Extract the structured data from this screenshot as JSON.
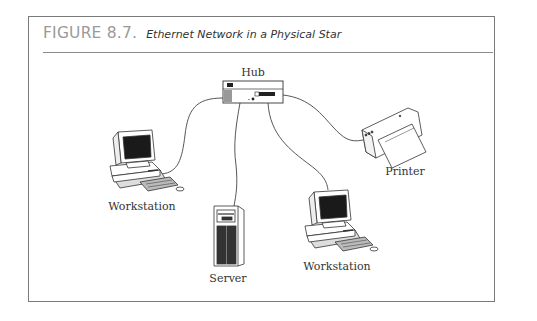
{
  "figure": {
    "number": "FIGURE 8.7.",
    "title": "Ethernet Network in a Physical Star"
  },
  "nodes": {
    "hub": {
      "label": "Hub"
    },
    "workstation_left": {
      "label": "Workstation"
    },
    "server": {
      "label": "Server"
    },
    "workstation_right": {
      "label": "Workstation"
    },
    "printer": {
      "label": "Printer"
    }
  },
  "topology": "physical star",
  "connections": [
    {
      "from": "Hub",
      "to": "Workstation (left)"
    },
    {
      "from": "Hub",
      "to": "Server"
    },
    {
      "from": "Hub",
      "to": "Workstation (right)"
    },
    {
      "from": "Hub",
      "to": "Printer"
    }
  ]
}
